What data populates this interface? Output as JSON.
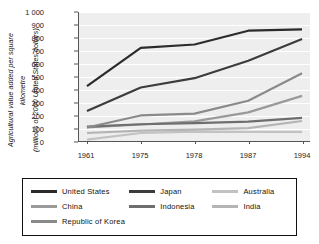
{
  "chart_data": {
    "type": "line",
    "title": "",
    "ylabel": "Agricultural value added per square kilometre (millions of 2000 United States dollars)",
    "ylabel_lines": [
      "Agricultural value added per square",
      "kilometre",
      "(millions of 2000 United States dollars)"
    ],
    "xlabel": "",
    "categories": [
      "1961",
      "1975",
      "1978",
      "1987",
      "1994"
    ],
    "x": [
      1961,
      1975,
      1978,
      1987,
      1994
    ],
    "ylim": [
      0,
      1000
    ],
    "yticks": [
      "0",
      "100",
      "200",
      "300",
      "400",
      "500",
      "600",
      "700",
      "800",
      "900",
      "1 000"
    ],
    "ytick_values": [
      0,
      100,
      200,
      300,
      400,
      500,
      600,
      700,
      800,
      900,
      1000
    ],
    "grid": true,
    "grid_color": "#ffffff",
    "plot_background": "#eeeeee",
    "legend_position": "bottom",
    "series": [
      {
        "name": "United States",
        "color": "#2b2b2b",
        "values": [
          425,
          722,
          748,
          855,
          865
        ]
      },
      {
        "name": "Japan",
        "color": "#3c3c3c",
        "values": [
          232,
          415,
          487,
          622,
          790
        ]
      },
      {
        "name": "Australia",
        "color": "#c2c2c2",
        "values": [
          10,
          62,
          72,
          70,
          70
        ]
      },
      {
        "name": "China",
        "color": "#9a9a9a",
        "values": [
          105,
          128,
          152,
          222,
          350
        ]
      },
      {
        "name": "Indonesia",
        "color": "#6e6e6e",
        "values": [
          112,
          130,
          138,
          150,
          180
        ]
      },
      {
        "name": "India",
        "color": "#b4b4b4",
        "values": [
          62,
          80,
          88,
          100,
          155
        ]
      },
      {
        "name": "Republic of Korea",
        "color": "#8a8a8a",
        "values": [
          105,
          198,
          212,
          312,
          525
        ]
      }
    ]
  },
  "legend": {
    "rows": [
      [
        "United States",
        "Japan",
        "Australia"
      ],
      [
        "China",
        "Indonesia",
        "India"
      ],
      [
        "Republic of Korea"
      ]
    ]
  }
}
